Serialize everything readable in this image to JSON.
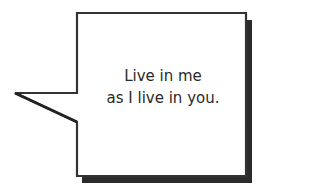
{
  "bubble": {
    "lines": [
      "Live in me",
      "as I live in you."
    ],
    "stroke_color": "#333333",
    "shadow_color": "#2b2b2b",
    "fill_color": "#ffffff"
  }
}
